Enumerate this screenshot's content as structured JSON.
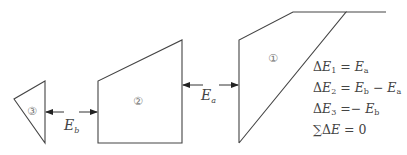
{
  "diagram": {
    "type": "slope-slice-force-diagram",
    "slices": [
      {
        "id": 1,
        "label": "①",
        "points": [
          [
            239,
            143
          ],
          [
            239,
            40
          ],
          [
            293,
            12
          ],
          [
            346,
            12
          ]
        ],
        "extension_top_line_to_x": 386
      },
      {
        "id": 2,
        "label": "②",
        "points": [
          [
            98,
            143
          ],
          [
            98,
            81
          ],
          [
            182,
            40
          ],
          [
            182,
            143
          ]
        ]
      },
      {
        "id": 3,
        "label": "③",
        "points": [
          [
            45,
            81
          ],
          [
            14,
            99
          ],
          [
            45,
            143
          ]
        ]
      }
    ],
    "forces": [
      {
        "name": "E",
        "subscript": "a",
        "between": [
          2,
          1
        ],
        "y": 85
      },
      {
        "name": "E",
        "subscript": "b",
        "between": [
          3,
          2
        ],
        "y": 112
      }
    ],
    "equations": [
      {
        "lhs": "ΔE",
        "lhs_sub": "1",
        "rhs": [
          {
            "t": "E",
            "s": "a"
          }
        ],
        "text": "ΔE₁ = Eₐ"
      },
      {
        "lhs": "ΔE",
        "lhs_sub": "2",
        "rhs": [
          {
            "t": "E",
            "s": "b"
          },
          {
            "op": " − "
          },
          {
            "t": "E",
            "s": "a"
          }
        ],
        "text": "ΔE₂ = E_b − Eₐ"
      },
      {
        "lhs": "ΔE",
        "lhs_sub": "3",
        "rhs": [
          {
            "op": "− "
          },
          {
            "t": "E",
            "s": "b"
          }
        ],
        "text": "ΔE₃ =− E_b"
      },
      {
        "lhs": "∑ΔE",
        "lhs_sub": "",
        "rhs": [
          {
            "op": "0"
          }
        ],
        "text": "∑ΔE = 0"
      }
    ],
    "text": {
      "slice1": "①",
      "slice2": "②",
      "slice3": "③",
      "force_a_main": "E",
      "force_a_sub": "a",
      "force_b_main": "E",
      "force_b_sub": "b",
      "eq1_delta": "Δ",
      "eq1_E": "E",
      "eq1_sub": "1",
      "eq1_eq": " = ",
      "eq1_r1": "E",
      "eq1_r1s": "a",
      "eq2_delta": "Δ",
      "eq2_E": "E",
      "eq2_sub": "2",
      "eq2_eq": " = ",
      "eq2_r1": "E",
      "eq2_r1s": "b",
      "eq2_op": " − ",
      "eq2_r2": "E",
      "eq2_r2s": "a",
      "eq3_delta": "Δ",
      "eq3_E": "E",
      "eq3_sub": "3",
      "eq3_eq": " =− ",
      "eq3_r1": "E",
      "eq3_r1s": "b",
      "eq4_sum": "∑",
      "eq4_delta": "Δ",
      "eq4_E": "E",
      "eq4_eq": " = ",
      "eq4_zero": "0"
    }
  }
}
